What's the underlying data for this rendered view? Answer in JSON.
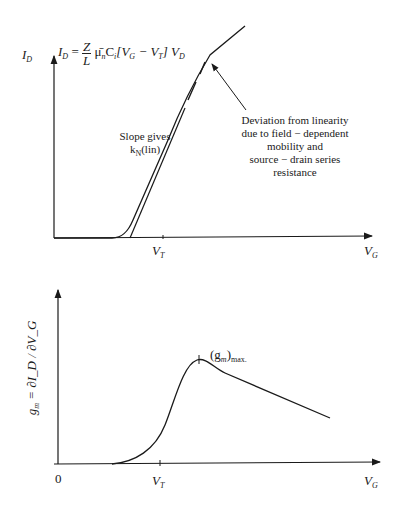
{
  "top_plot": {
    "y_axis_label": "I",
    "y_axis_label_sub": "D",
    "x_axis_label": "V",
    "x_axis_label_sub": "G",
    "vt_label": "V",
    "vt_label_sub": "T",
    "equation": {
      "lhs": "I",
      "lhs_sub": "D",
      "equals": "=",
      "frac_num": "Z",
      "frac_den": "L",
      "mu": "μ̄",
      "mu_sub": "n",
      "c": "C",
      "c_sub": "i",
      "bracket": "[V",
      "vg_sub": "G",
      "minus": " − V",
      "vt_sub": "T",
      "close": "] V",
      "vd_sub": "D"
    },
    "slope_note_line1": "Slope gives",
    "slope_note_line2": "k",
    "slope_note_sub": "N",
    "slope_note_suffix": "(lin)",
    "deviation_note": [
      "Deviation from linearity",
      "due to field − dependent",
      "mobility and",
      "source − drain series",
      "resistance"
    ]
  },
  "bottom_plot": {
    "y_axis_label": "g",
    "y_axis_label_sub": "m",
    "y_axis_eq": " = ∂I_D / ∂V_G",
    "x_axis_label": "V",
    "x_axis_label_sub": "G",
    "origin_label": "0",
    "vt_label": "V",
    "vt_label_sub": "T",
    "peak_label": "(g",
    "peak_label_sub": "m",
    "peak_label_suffix": ")",
    "peak_label_max": "max."
  }
}
